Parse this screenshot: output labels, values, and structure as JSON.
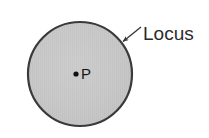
{
  "figure": {
    "background_color": "#ffffff"
  },
  "shapes": {
    "circle": {
      "name": "locus-circle",
      "center_x": 80,
      "center_y": 74,
      "radius": 52,
      "fill_color": "#c9c9c9",
      "stroke_color": "#3a3a3a",
      "stroke_width": 2.2,
      "texture": "fine vertical hatch"
    },
    "center_point": {
      "name": "point-p",
      "x": 76,
      "y": 74,
      "radius": 2.6,
      "color": "#111111"
    }
  },
  "labels": {
    "locus": {
      "text": "Locus",
      "x": 143,
      "y": 40,
      "color": "#2b2b2b",
      "font_size": 19
    },
    "point_p": {
      "text": "P",
      "x": 81,
      "y": 79,
      "color": "#151515",
      "font_size": 15
    }
  },
  "annotations": {
    "leader_line": {
      "name": "locus-leader-arrow",
      "from_x": 141,
      "from_y": 27,
      "to_x": 122,
      "to_y": 42,
      "color": "#3a3a3a",
      "stroke_width": 1.4,
      "arrowhead_at": "to"
    }
  }
}
